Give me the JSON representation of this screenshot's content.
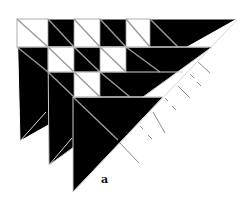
{
  "figure": {
    "caption": "a",
    "colors": {
      "fill": "#000000",
      "background": "#ffffff",
      "line": "#bdbdbd",
      "hatch": "#8a8a8a"
    },
    "triangles": [
      {
        "name": "triangle-back",
        "points": "17,19 237,19 20,141"
      },
      {
        "name": "triangle-middle",
        "points": "48,47 212,47 49,165"
      },
      {
        "name": "triangle-front",
        "points": "73,97 163,97 73,192"
      }
    ],
    "white_squares": [
      {
        "x": 17,
        "y": 19,
        "w": 31,
        "h": 28
      },
      {
        "x": 74,
        "y": 19,
        "w": 26,
        "h": 28
      },
      {
        "x": 126,
        "y": 19,
        "w": 24,
        "h": 28
      },
      {
        "x": 48,
        "y": 47,
        "w": 26,
        "h": 25
      },
      {
        "x": 100,
        "y": 47,
        "w": 26,
        "h": 25
      },
      {
        "x": 74,
        "y": 72,
        "w": 26,
        "h": 25
      }
    ],
    "hatch_marks": 10
  }
}
